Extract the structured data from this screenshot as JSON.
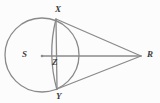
{
  "figure": {
    "kind": "circle-geometry-diagram",
    "background_color": "#fcfcfc",
    "stroke_color": "#8a8a8a",
    "label_color": "#3d3d3d",
    "stroke_width": 1.3,
    "width": 160,
    "height": 103
  },
  "points": [
    {
      "id": "X",
      "label": "X",
      "x": 56,
      "y": 19,
      "label_x": 55,
      "label_y": 5,
      "role": "chord-endpoint-top"
    },
    {
      "id": "S",
      "label": "S",
      "x": 42,
      "y": 56,
      "label_x": 22,
      "label_y": 50,
      "role": "circle-center"
    },
    {
      "id": "Z",
      "label": "Z",
      "x": 56,
      "y": 56,
      "label_x": 52,
      "label_y": 58,
      "role": "chord-intersection"
    },
    {
      "id": "Y",
      "label": "Y",
      "x": 57,
      "y": 90,
      "label_x": 56,
      "label_y": 92,
      "role": "chord-endpoint-bottom"
    },
    {
      "id": "R",
      "label": "R",
      "x": 141,
      "y": 56,
      "label_x": 147,
      "label_y": 50,
      "role": "external-apex"
    }
  ],
  "circle": {
    "center_x": 42,
    "center_y": 55,
    "radius": 37
  },
  "segments": [
    {
      "id": "SR",
      "from": "S",
      "to": "R",
      "x1": 42,
      "y1": 56,
      "x2": 141,
      "y2": 56
    },
    {
      "id": "XR",
      "from": "X",
      "to": "R",
      "x1": 56,
      "y1": 19,
      "x2": 141,
      "y2": 56
    },
    {
      "id": "YR",
      "from": "Y",
      "to": "R",
      "x1": 57,
      "y1": 89,
      "x2": 141,
      "y2": 56
    },
    {
      "id": "XY",
      "from": "X",
      "to": "Y",
      "x1": 56,
      "y1": 19,
      "x2": 57,
      "y2": 89
    }
  ],
  "arcs": [
    {
      "id": "arc-XY-minor",
      "from": "X",
      "to": "Y",
      "bulge_x": 47,
      "note": "minor arc bulging left of chord XY"
    }
  ],
  "center_dot": {
    "x": 42,
    "y": 56,
    "radius": 1.3
  }
}
